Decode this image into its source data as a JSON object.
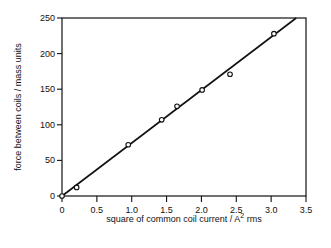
{
  "chart_data": {
    "type": "scatter",
    "title": "",
    "xlabel": "square of common coil current / A² rms",
    "xlabel_main": "square of common coil current / A",
    "xlabel_sup": "2",
    "xlabel_tail": " rms",
    "ylabel": "force between coils / mass units",
    "xlim": [
      0,
      3.5
    ],
    "ylim": [
      0,
      250
    ],
    "xticks": [
      "0",
      "0.5",
      "1.0",
      "1.5",
      "2.0",
      "2.5",
      "3.0",
      "3.5"
    ],
    "yticks": [
      "0",
      "50",
      "100",
      "150",
      "200",
      "250"
    ],
    "grid": false,
    "legend": null,
    "series": [
      {
        "name": "measured",
        "marker": "open-circle",
        "x": [
          0,
          0.21,
          0.95,
          1.43,
          1.65,
          2.01,
          2.41,
          3.04
        ],
        "y": [
          0,
          12,
          72,
          107,
          126,
          149,
          171,
          228
        ]
      },
      {
        "name": "fit line",
        "style": "line",
        "x": [
          0,
          3.36
        ],
        "y": [
          0,
          250
        ]
      }
    ]
  }
}
